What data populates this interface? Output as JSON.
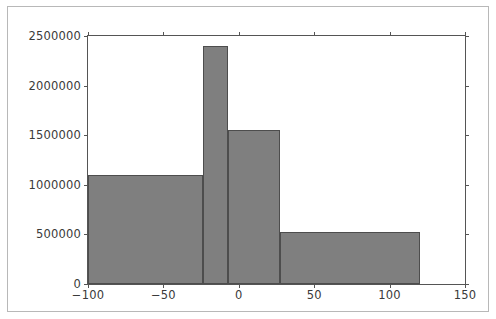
{
  "figure": {
    "background_color": "#ffffff",
    "frame_color": "#b8b8b8",
    "axes_color": "#555555"
  },
  "chart_data": {
    "type": "bar",
    "title": "",
    "subtitle": "",
    "xlabel": "",
    "ylabel": "",
    "legend": [],
    "grid": false,
    "bar_fill_color": "#7f7f7f",
    "bar_edge_color": "#4d4d4d",
    "xlim": [
      -100,
      150
    ],
    "ylim": [
      0,
      2500000
    ],
    "xticks": [
      -100,
      -50,
      0,
      50,
      100,
      150
    ],
    "xtick_labels": [
      "−100",
      "−50",
      "0",
      "50",
      "100",
      "150"
    ],
    "yticks": [
      0,
      500000,
      1000000,
      1500000,
      2000000,
      2500000
    ],
    "ytick_labels": [
      "0",
      "500000",
      "1000000",
      "1500000",
      "2000000",
      "2500000"
    ],
    "bin_edges": [
      -100,
      -24,
      -7,
      27,
      120
    ],
    "bars": [
      {
        "left": -100,
        "right": -24,
        "value": 1100000
      },
      {
        "left": -24,
        "right": -7,
        "value": 2400000
      },
      {
        "left": -7,
        "right": 27,
        "value": 1550000
      },
      {
        "left": 27,
        "right": 120,
        "value": 520000
      }
    ],
    "values": [
      1100000,
      2400000,
      1550000,
      520000
    ],
    "categories": [
      "-100 to -24",
      "-24 to -7",
      "-7 to 27",
      "27 to 120"
    ]
  }
}
